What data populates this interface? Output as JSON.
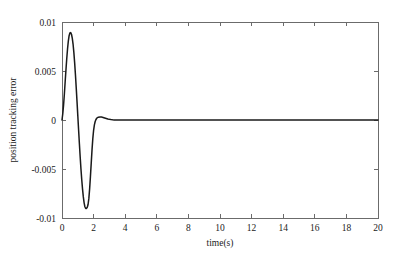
{
  "chart_data": {
    "type": "line",
    "title": "",
    "xlabel": "time(s)",
    "ylabel": "position tracking error",
    "xlim": [
      0,
      20
    ],
    "ylim": [
      -0.01,
      0.01
    ],
    "grid": false,
    "legend": null,
    "xticks": [
      0,
      2,
      4,
      6,
      8,
      10,
      12,
      14,
      16,
      18,
      20
    ],
    "xtick_labels": [
      "0",
      "2",
      "4",
      "6",
      "8",
      "10",
      "12",
      "14",
      "16",
      "18",
      "20"
    ],
    "yticks": [
      -0.01,
      -0.005,
      0,
      0.005,
      0.01
    ],
    "ytick_labels": [
      "-0.01",
      "-0.005",
      "0",
      "0.005",
      "0.01"
    ],
    "line_color": "#1a1a1a",
    "series": [
      {
        "name": "position tracking error",
        "x": [
          0.0,
          0.05,
          0.1,
          0.15,
          0.2,
          0.25,
          0.3,
          0.35,
          0.4,
          0.45,
          0.5,
          0.55,
          0.6,
          0.65,
          0.7,
          0.75,
          0.8,
          0.85,
          0.9,
          0.95,
          1.0,
          1.05,
          1.1,
          1.15,
          1.2,
          1.25,
          1.3,
          1.35,
          1.4,
          1.45,
          1.5,
          1.55,
          1.6,
          1.65,
          1.7,
          1.75,
          1.8,
          1.85,
          1.9,
          1.95,
          2.0,
          2.05,
          2.1,
          2.15,
          2.2,
          2.25,
          2.3,
          2.4,
          2.5,
          2.6,
          2.7,
          2.8,
          2.9,
          3.0,
          3.1,
          3.2,
          3.3,
          3.4,
          3.5,
          3.6,
          3.8,
          4.0,
          4.5,
          5.0,
          6.0,
          8.0,
          10.0,
          12.0,
          14.0,
          16.0,
          18.0,
          20.0
        ],
        "y": [
          0.0,
          0.00065,
          0.00155,
          0.00265,
          0.0039,
          0.0051,
          0.00625,
          0.00725,
          0.00805,
          0.0086,
          0.00888,
          0.00892,
          0.00875,
          0.00835,
          0.00775,
          0.0069,
          0.00585,
          0.00465,
          0.0033,
          0.0019,
          0.00045,
          -0.001,
          -0.0024,
          -0.00375,
          -0.005,
          -0.0061,
          -0.00705,
          -0.00785,
          -0.00845,
          -0.00885,
          -0.00903,
          -0.00902,
          -0.0089,
          -0.00862,
          -0.008,
          -0.007,
          -0.00575,
          -0.0044,
          -0.00305,
          -0.0019,
          -0.00105,
          -0.0005,
          -0.00015,
          5e-05,
          0.00018,
          0.00025,
          0.00029,
          0.00031,
          0.0003,
          0.00026,
          0.00021,
          0.00016,
          0.00011,
          7e-05,
          4e-05,
          2e-05,
          1e-05,
          0.0,
          -1e-05,
          -1e-05,
          -1e-05,
          0.0,
          0.0,
          0.0,
          0.0,
          0.0,
          0.0,
          0.0,
          0.0,
          0.0,
          0.0,
          0.0
        ],
        "peak_positive": {
          "t": 0.55,
          "value": 0.0089
        },
        "peak_negative": {
          "t": 1.52,
          "value": -0.009
        },
        "settling_time": 4.0
      }
    ]
  }
}
